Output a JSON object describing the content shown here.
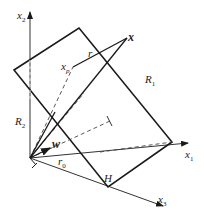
{
  "diagram": {
    "type": "geometry-hyperplane",
    "colors": {
      "stroke": "#1a1a1a",
      "dashed": "#444444",
      "background": "#ffffff"
    },
    "labels": {
      "x2": "x",
      "x2_sub": "2",
      "x1": "x",
      "x1_sub": "1",
      "x3": "x",
      "x3_sub": "3",
      "x": "x",
      "xp": "x",
      "xp_sub": "p",
      "r": "r",
      "R1": "R",
      "R1_sub": "1",
      "R2": "R",
      "R2_sub": "2",
      "w": "w",
      "r0": "r",
      "r0_sub": "0",
      "H": "H"
    }
  }
}
